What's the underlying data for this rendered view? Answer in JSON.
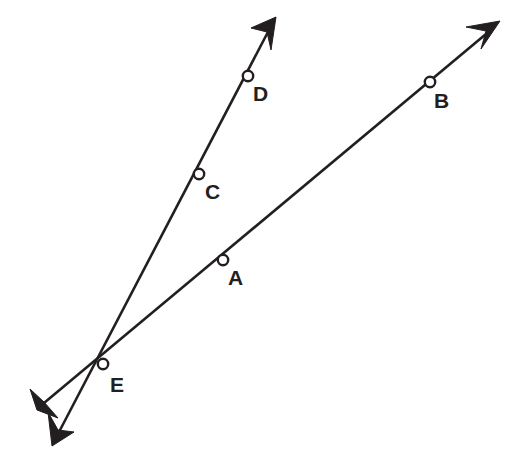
{
  "diagram": {
    "background_color": "#ffffff",
    "stroke_color": "#231f20",
    "point_fill_color": "#ffffff",
    "width": 514,
    "height": 468,
    "points": [
      {
        "label": "A",
        "x": 223,
        "y": 260,
        "label_x": 228,
        "label_y": 285,
        "on_line": "EAB"
      },
      {
        "label": "B",
        "x": 430,
        "y": 82,
        "label_x": 434,
        "label_y": 108,
        "on_line": "EAB"
      },
      {
        "label": "C",
        "x": 199,
        "y": 174,
        "label_x": 205,
        "label_y": 199,
        "on_line": "ECD"
      },
      {
        "label": "D",
        "x": 248,
        "y": 76,
        "label_x": 253,
        "label_y": 101,
        "on_line": "ECD"
      },
      {
        "label": "E",
        "x": 103,
        "y": 364,
        "label_x": 110,
        "label_y": 392,
        "on_line": "both"
      }
    ],
    "lines": [
      {
        "name": "line-EAB",
        "label": "Line through E, A, B",
        "x1": 44,
        "y1": 403,
        "x2": 492,
        "y2": 29,
        "slope": -0.835,
        "arrow_start": {
          "tip_x": 37,
          "tip_y": 410,
          "left_x": 30,
          "left_y": 389,
          "right_x": 58,
          "right_y": 418,
          "notch_x": 44,
          "notch_y": 402
        },
        "arrow_end": {
          "tip_x": 500,
          "tip_y": 21,
          "left_x": 466,
          "left_y": 27,
          "right_x": 481,
          "right_y": 49,
          "notch_x": 486,
          "notch_y": 31
        }
      },
      {
        "name": "line-ECD",
        "label": "Line through E, C, D",
        "x1": 59,
        "y1": 432,
        "x2": 269,
        "y2": 30,
        "slope": -2.0,
        "arrow_start": {
          "tip_x": 52,
          "tip_y": 446,
          "left_x": 48,
          "left_y": 412,
          "right_x": 74,
          "right_y": 432,
          "notch_x": 58,
          "notch_y": 430
        },
        "arrow_end": {
          "tip_x": 276,
          "tip_y": 17,
          "left_x": 251,
          "left_y": 28,
          "right_x": 271,
          "right_y": 50,
          "notch_x": 267,
          "notch_y": 32
        }
      }
    ],
    "point_radius": 5.2
  }
}
